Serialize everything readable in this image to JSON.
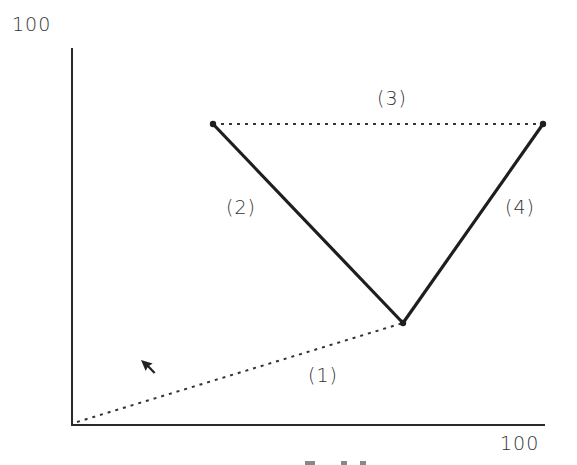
{
  "axes": {
    "y_max_label": "100",
    "x_max_label": "100"
  },
  "segments": [
    {
      "id": "1",
      "label": "(1)",
      "style": "dotted",
      "from": [
        0,
        0
      ],
      "to": [
        70,
        26
      ]
    },
    {
      "id": "2",
      "label": "(2)",
      "style": "solid",
      "from": [
        30,
        80
      ],
      "to": [
        70,
        26
      ]
    },
    {
      "id": "3",
      "label": "(3)",
      "style": "dotted",
      "from": [
        30,
        80
      ],
      "to": [
        100,
        80
      ]
    },
    {
      "id": "4",
      "label": "(4)",
      "style": "solid",
      "from": [
        70,
        26
      ],
      "to": [
        100,
        80
      ]
    }
  ],
  "labels": {
    "seg1": "(1)",
    "seg2": "(2)",
    "seg3": "(3)",
    "seg4": "(4)"
  },
  "cursor": {
    "icon": "arrow-cursor-icon"
  },
  "colors": {
    "line": "#222222",
    "background": "#ffffff"
  }
}
